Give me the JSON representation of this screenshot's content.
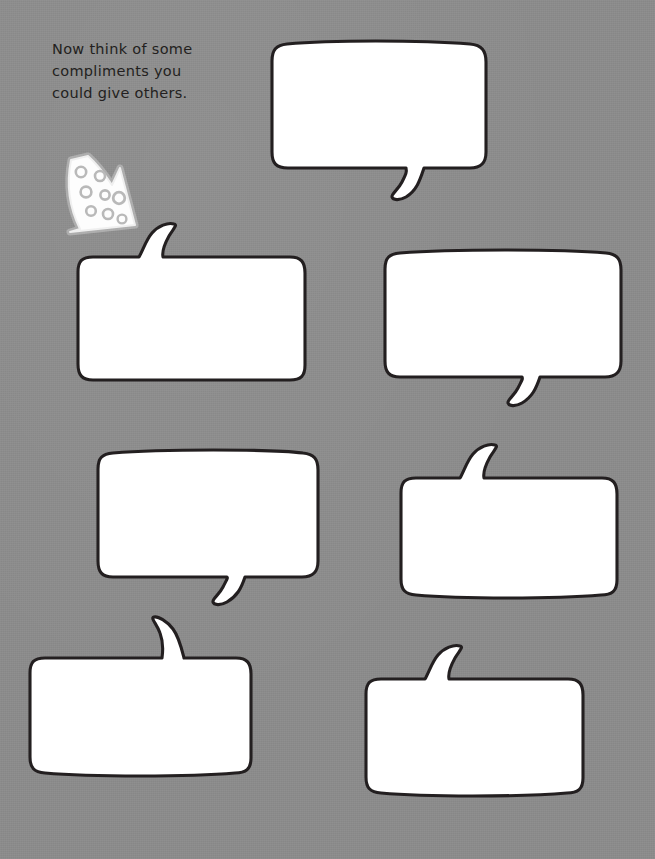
{
  "page": {
    "background_color": "#8c8c8c",
    "width": 655,
    "height": 859
  },
  "instruction": {
    "text": "Now think of some\ncompliments you\ncould give others.",
    "color": "#231f20"
  },
  "arrow": {
    "name": "polka-dot-arrow",
    "direction": "down-right",
    "fill_color": "#fdfdfd",
    "dot_color": "#b9b9b9",
    "dot_count": 8
  },
  "bubbles": [
    {
      "id": "bubble-1",
      "index": 1,
      "tail": "bottom",
      "fill_color": "#ffffff",
      "outline_color": "#231f20",
      "text": "",
      "placeholder": "",
      "bounds": {
        "x": 272,
        "y": 43,
        "w": 214,
        "h": 126
      }
    },
    {
      "id": "bubble-2",
      "index": 2,
      "tail": "top",
      "fill_color": "#ffffff",
      "outline_color": "#231f20",
      "text": "",
      "placeholder": "",
      "bounds": {
        "x": 78,
        "y": 256,
        "w": 227,
        "h": 124
      }
    },
    {
      "id": "bubble-3",
      "index": 3,
      "tail": "bottom",
      "fill_color": "#ffffff",
      "outline_color": "#231f20",
      "text": "",
      "placeholder": "",
      "bounds": {
        "x": 385,
        "y": 252,
        "w": 236,
        "h": 125
      }
    },
    {
      "id": "bubble-4",
      "index": 4,
      "tail": "bottom",
      "fill_color": "#ffffff",
      "outline_color": "#231f20",
      "text": "",
      "placeholder": "",
      "bounds": {
        "x": 98,
        "y": 452,
        "w": 220,
        "h": 125
      }
    },
    {
      "id": "bubble-5",
      "index": 5,
      "tail": "top",
      "fill_color": "#ffffff",
      "outline_color": "#231f20",
      "text": "",
      "placeholder": "",
      "bounds": {
        "x": 401,
        "y": 477,
        "w": 216,
        "h": 118
      }
    },
    {
      "id": "bubble-6",
      "index": 6,
      "tail": "top",
      "fill_color": "#ffffff",
      "outline_color": "#231f20",
      "text": "",
      "placeholder": "",
      "bounds": {
        "x": 30,
        "y": 657,
        "w": 221,
        "h": 116
      }
    },
    {
      "id": "bubble-7",
      "index": 7,
      "tail": "top",
      "fill_color": "#ffffff",
      "outline_color": "#231f20",
      "text": "",
      "placeholder": "",
      "bounds": {
        "x": 366,
        "y": 678,
        "w": 217,
        "h": 115
      }
    }
  ]
}
